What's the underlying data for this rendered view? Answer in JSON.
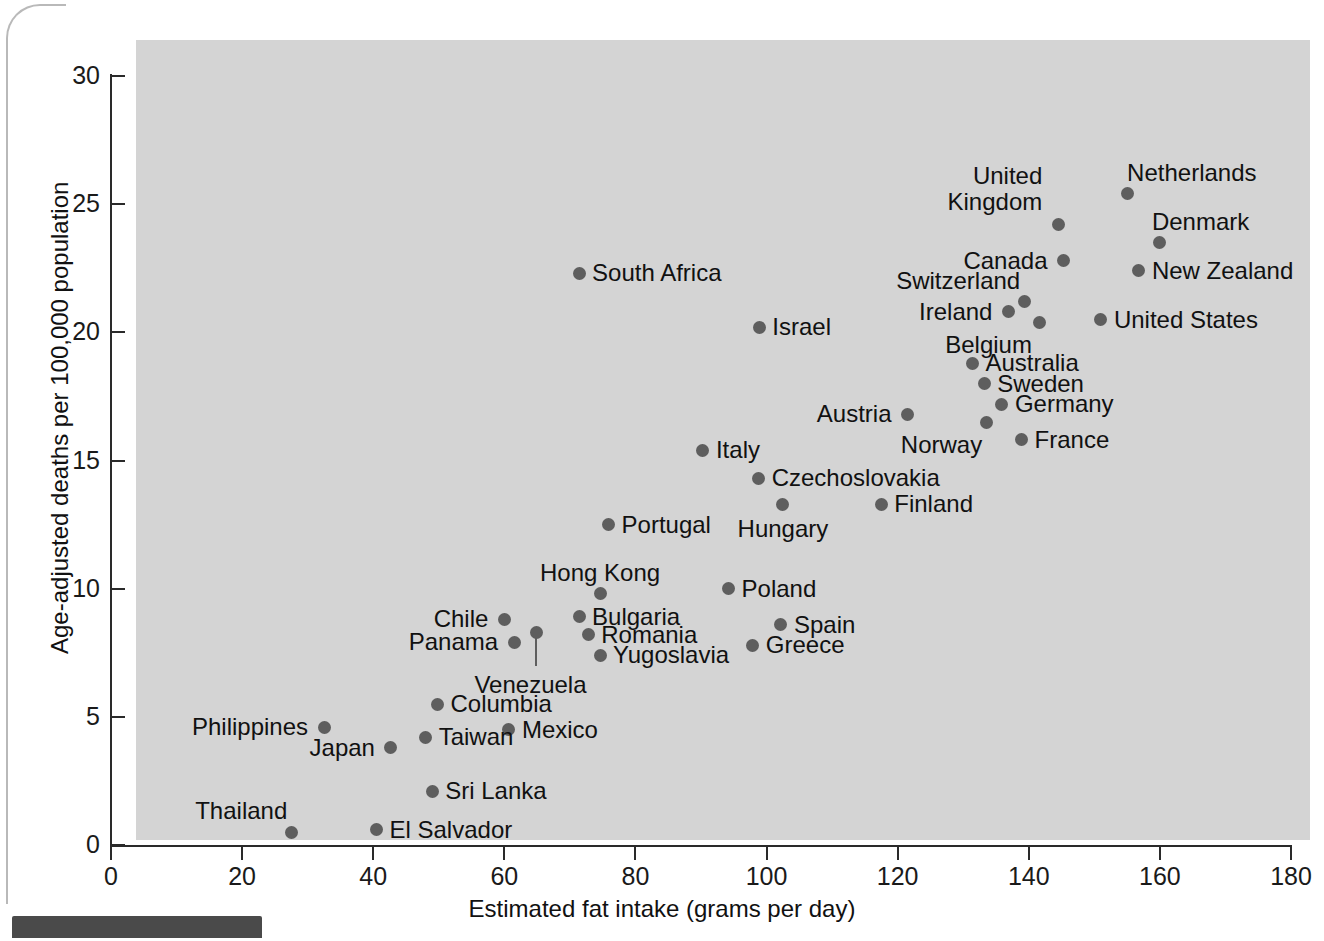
{
  "chart_data": {
    "type": "scatter",
    "title": "",
    "xlabel": "Estimated fat intake (grams per day)",
    "ylabel": "Age-adjusted deaths per 100,000 population",
    "xlim": [
      0,
      180
    ],
    "ylim": [
      0,
      30
    ],
    "xticks": [
      "0",
      "20",
      "40",
      "60",
      "80",
      "100",
      "120",
      "140",
      "160",
      "180"
    ],
    "yticks": [
      "0",
      "5",
      "10",
      "15",
      "20",
      "25",
      "30"
    ],
    "grid": false,
    "legend": null,
    "marker_color": "#5e5e5e",
    "plot_background": "#d4d4d4",
    "points": [
      {
        "name": "Netherlands",
        "x": 155.0,
        "y": 25.4,
        "label": "Netherlands",
        "label_dx": 0,
        "label_dy": -34,
        "align": "left"
      },
      {
        "name": "United Kingdom",
        "x": 144.5,
        "y": 24.2,
        "label": "United\nKingdom",
        "label_dx": -16,
        "label_dy": -62,
        "align": "right"
      },
      {
        "name": "Denmark",
        "x": 160.0,
        "y": 23.5,
        "label": "Denmark",
        "label_dx": -8,
        "label_dy": -34,
        "align": "left"
      },
      {
        "name": "Canada",
        "x": 145.3,
        "y": 22.8,
        "label": "Canada",
        "label_dx": -16,
        "label_dy": -13,
        "align": "right"
      },
      {
        "name": "New Zealand",
        "x": 156.8,
        "y": 22.4,
        "label": "New Zealand",
        "label_dx": 13,
        "label_dy": -13,
        "align": "left"
      },
      {
        "name": "South Africa",
        "x": 71.4,
        "y": 22.3,
        "label": "South Africa",
        "label_dx": 13,
        "label_dy": -13,
        "align": "left"
      },
      {
        "name": "Switzerland",
        "x": 139.3,
        "y": 21.2,
        "label": "Switzerland",
        "label_dx": -4,
        "label_dy": -34,
        "align": "right"
      },
      {
        "name": "Belgium",
        "x": 141.7,
        "y": 20.4,
        "label": "Belgium",
        "label_dx": -8,
        "label_dy": 10,
        "align": "right"
      },
      {
        "name": "Ireland",
        "x": 136.9,
        "y": 20.8,
        "label": "Ireland",
        "label_dx": -16,
        "label_dy": -13,
        "align": "right"
      },
      {
        "name": "United States",
        "x": 151.0,
        "y": 20.5,
        "label": "United States",
        "label_dx": 13,
        "label_dy": -13,
        "align": "left"
      },
      {
        "name": "Israel",
        "x": 98.9,
        "y": 20.2,
        "label": "Israel",
        "label_dx": 13,
        "label_dy": -13,
        "align": "left"
      },
      {
        "name": "Australia",
        "x": 131.4,
        "y": 18.8,
        "label": "Australia",
        "label_dx": 13,
        "label_dy": -13,
        "align": "left"
      },
      {
        "name": "Sweden",
        "x": 133.2,
        "y": 18.0,
        "label": "Sweden",
        "label_dx": 13,
        "label_dy": -13,
        "align": "left"
      },
      {
        "name": "Germany",
        "x": 135.9,
        "y": 17.2,
        "label": "Germany",
        "label_dx": 13,
        "label_dy": -13,
        "align": "left"
      },
      {
        "name": "Austria",
        "x": 121.5,
        "y": 16.8,
        "label": "Austria",
        "label_dx": -16,
        "label_dy": -13,
        "align": "right"
      },
      {
        "name": "Norway",
        "x": 133.5,
        "y": 16.5,
        "label": "Norway",
        "label_dx": -4,
        "label_dy": 10,
        "align": "right"
      },
      {
        "name": "France",
        "x": 138.9,
        "y": 15.8,
        "label": "France",
        "label_dx": 13,
        "label_dy": -13,
        "align": "left"
      },
      {
        "name": "Italy",
        "x": 90.3,
        "y": 15.4,
        "label": "Italy",
        "label_dx": 13,
        "label_dy": -13,
        "align": "left"
      },
      {
        "name": "Czechoslovakia",
        "x": 98.8,
        "y": 14.3,
        "label": "Czechoslovakia",
        "label_dx": 13,
        "label_dy": -13,
        "align": "left"
      },
      {
        "name": "Finland",
        "x": 117.5,
        "y": 13.3,
        "label": "Finland",
        "label_dx": 13,
        "label_dy": -13,
        "align": "left"
      },
      {
        "name": "Hungary",
        "x": 102.5,
        "y": 13.3,
        "label": "Hungary",
        "label_dx": 0,
        "label_dy": 12,
        "align": "center"
      },
      {
        "name": "Portugal",
        "x": 75.9,
        "y": 12.5,
        "label": "Portugal",
        "label_dx": 13,
        "label_dy": -13,
        "align": "left"
      },
      {
        "name": "Poland",
        "x": 94.2,
        "y": 10.0,
        "label": "Poland",
        "label_dx": 13,
        "label_dy": -13,
        "align": "left"
      },
      {
        "name": "Hong Kong",
        "x": 74.6,
        "y": 9.8,
        "label": "Hong Kong",
        "label_dx": 0,
        "label_dy": -34,
        "align": "center"
      },
      {
        "name": "Chile",
        "x": 60.0,
        "y": 8.8,
        "label": "Chile",
        "label_dx": -16,
        "label_dy": -13,
        "align": "right"
      },
      {
        "name": "Bulgaria",
        "x": 71.4,
        "y": 8.9,
        "label": "Bulgaria",
        "label_dx": 13,
        "label_dy": -13,
        "align": "left"
      },
      {
        "name": "Spain",
        "x": 102.2,
        "y": 8.6,
        "label": "Spain",
        "label_dx": 13,
        "label_dy": -13,
        "align": "left"
      },
      {
        "name": "Venezuela",
        "x": 64.9,
        "y": 8.3,
        "label": "Venezuela",
        "label_dx": -6,
        "label_dy": 40,
        "align": "center",
        "leader": true
      },
      {
        "name": "Romania",
        "x": 72.8,
        "y": 8.2,
        "label": "Romania",
        "label_dx": 13,
        "label_dy": -13,
        "align": "left"
      },
      {
        "name": "Panama",
        "x": 61.5,
        "y": 7.9,
        "label": "Panama",
        "label_dx": -16,
        "label_dy": -13,
        "align": "right"
      },
      {
        "name": "Greece",
        "x": 97.9,
        "y": 7.8,
        "label": "Greece",
        "label_dx": 13,
        "label_dy": -13,
        "align": "left"
      },
      {
        "name": "Yugoslavia",
        "x": 74.6,
        "y": 7.4,
        "label": "Yugoslavia",
        "label_dx": 13,
        "label_dy": -13,
        "align": "left"
      },
      {
        "name": "Columbia",
        "x": 49.8,
        "y": 5.5,
        "label": "Columbia",
        "label_dx": 13,
        "label_dy": -13,
        "align": "left"
      },
      {
        "name": "Philippines",
        "x": 32.5,
        "y": 4.6,
        "label": "Philippines",
        "label_dx": -16,
        "label_dy": -13,
        "align": "right"
      },
      {
        "name": "Mexico",
        "x": 60.7,
        "y": 4.5,
        "label": "Mexico",
        "label_dx": 13,
        "label_dy": -13,
        "align": "left"
      },
      {
        "name": "Taiwan",
        "x": 48.0,
        "y": 4.2,
        "label": "Taiwan",
        "label_dx": 13,
        "label_dy": -13,
        "align": "left"
      },
      {
        "name": "Japan",
        "x": 42.7,
        "y": 3.8,
        "label": "Japan",
        "label_dx": -16,
        "label_dy": -13,
        "align": "right"
      },
      {
        "name": "Sri Lanka",
        "x": 49.0,
        "y": 2.1,
        "label": "Sri Lanka",
        "label_dx": 13,
        "label_dy": -13,
        "align": "left"
      },
      {
        "name": "El Salvador",
        "x": 40.5,
        "y": 0.6,
        "label": "El Salvador",
        "label_dx": 13,
        "label_dy": -13,
        "align": "left"
      },
      {
        "name": "Thailand",
        "x": 27.5,
        "y": 0.5,
        "label": "Thailand",
        "label_dx": -4,
        "label_dy": -34,
        "align": "right"
      }
    ]
  }
}
